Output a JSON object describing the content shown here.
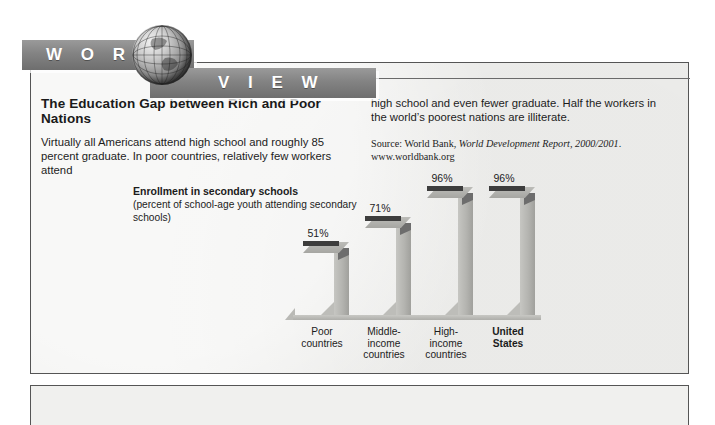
{
  "banner": {
    "word_left": "W O R L D",
    "word_right": "V I E W",
    "globe_icon": "globe-icon"
  },
  "article": {
    "headline": "The Education Gap between Rich and Poor Nations",
    "left_column": "Virtually all Americans attend high school and roughly 85 percent graduate. In poor countries, relatively few workers attend",
    "right_column": "high school and even fewer graduate. Half the workers in the world’s poorest nations are illiterate.",
    "source_prefix": "Source: World Bank, ",
    "source_italic": "World Development Report, 2000/2001",
    "source_suffix": ".",
    "source_url": "www.worldbank.org"
  },
  "chart_caption": {
    "title": "Enrollment in secondary schools",
    "subtitle": "(percent of school-age youth attending secondary schools)"
  },
  "chart_data": {
    "type": "bar",
    "title": "Enrollment in secondary schools",
    "subtitle": "(percent of school-age youth attending secondary schools)",
    "xlabel": "",
    "ylabel": "percent of school-age youth attending secondary schools",
    "ylim": [
      0,
      100
    ],
    "grid": false,
    "legend": false,
    "categories": [
      "Poor countries",
      "Middle-income countries",
      "High-income countries",
      "United States"
    ],
    "values": [
      51,
      71,
      96,
      96
    ],
    "value_labels": [
      "51%",
      "71%",
      "96%",
      "96%"
    ],
    "highlighted_category": "United States",
    "bars": [
      {
        "label_lines": [
          "Poor",
          "countries"
        ],
        "value": 51,
        "value_label": "51%",
        "highlighted": false
      },
      {
        "label_lines": [
          "Middle-",
          "income",
          "countries"
        ],
        "value": 71,
        "value_label": "71%",
        "highlighted": false
      },
      {
        "label_lines": [
          "High-",
          "income",
          "countries"
        ],
        "value": 96,
        "value_label": "96%",
        "highlighted": false
      },
      {
        "label_lines": [
          "United",
          "States"
        ],
        "value": 96,
        "value_label": "96%",
        "highlighted": true
      }
    ],
    "colors": {
      "bar_top": "#3d3d3d",
      "bar_face": "#b4b4b0",
      "background": "#f0f0ee"
    }
  }
}
